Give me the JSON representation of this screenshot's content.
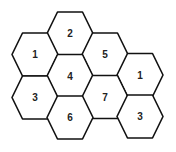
{
  "diagram": {
    "type": "hexagon-grid",
    "stroke_color": "#111111",
    "fill_color": "#ffffff",
    "label_color": "#222222",
    "hexagons": [
      {
        "label": "2",
        "cx": 70,
        "cy": 33.5
      },
      {
        "label": "1",
        "cx": 35,
        "cy": 54.5
      },
      {
        "label": "5",
        "cx": 105,
        "cy": 54.5
      },
      {
        "label": "4",
        "cx": 70,
        "cy": 76
      },
      {
        "label": "1",
        "cx": 140,
        "cy": 75
      },
      {
        "label": "3",
        "cx": 35,
        "cy": 97.5
      },
      {
        "label": "7",
        "cx": 105,
        "cy": 97
      },
      {
        "label": "6",
        "cx": 70,
        "cy": 117.5
      },
      {
        "label": "3",
        "cx": 140,
        "cy": 116.5
      }
    ]
  }
}
